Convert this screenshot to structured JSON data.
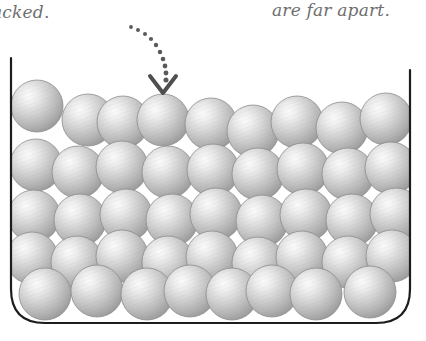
{
  "figure": {
    "background_color": "#ffffff"
  },
  "captions": {
    "left": {
      "text": "acked.",
      "full_text_hint": "packed.",
      "style": "italic",
      "color": "#6e6e6e",
      "clipped_at_left_edge": true
    },
    "right": {
      "text": "are far apart.",
      "style": "italic",
      "color": "#6e6e6e"
    }
  },
  "annotation": {
    "type": "dotted-curved-arrow",
    "dot_color": "#5a5a5a",
    "arrowhead": "chevron-down",
    "points_to": "top-row-sphere-4",
    "dots": [
      [
        131,
        27
      ],
      [
        138,
        30
      ],
      [
        145,
        34
      ],
      [
        151,
        39
      ],
      [
        156,
        45
      ],
      [
        160,
        52
      ],
      [
        163,
        59
      ],
      [
        165,
        66
      ],
      [
        166,
        73
      ],
      [
        166,
        80
      ]
    ],
    "arrow_apex": [
      163,
      93
    ],
    "arrow_left": [
      150,
      76
    ],
    "arrow_right": [
      176,
      76
    ]
  },
  "container": {
    "name": "beaker-open-container",
    "stroke_color": "#1d1d1d",
    "stroke_width": 2.2,
    "left_wall_x": 11,
    "right_wall_x": 410,
    "top_y_left": 58,
    "top_y_right": 70,
    "bottom_y": 323,
    "corner_radius": 34,
    "has_lid": false
  },
  "spheres": {
    "fill_light": "#f2f2f2",
    "fill_mid": "#c9c9c9",
    "fill_dark": "#9a9a9a",
    "edge_color": "#8d8d8d",
    "texture": "fine diagonal hatching",
    "count": 44,
    "rows": [
      {
        "row": 1,
        "label": "top-row",
        "items": [
          {
            "cx": 37,
            "cy": 106,
            "r": 26
          },
          {
            "cx": 88,
            "cy": 120,
            "r": 26
          },
          {
            "cx": 123,
            "cy": 122,
            "r": 26
          },
          {
            "cx": 163,
            "cy": 120,
            "r": 26
          },
          {
            "cx": 211,
            "cy": 124,
            "r": 26
          },
          {
            "cx": 253,
            "cy": 131,
            "r": 26
          },
          {
            "cx": 297,
            "cy": 122,
            "r": 26
          },
          {
            "cx": 342,
            "cy": 128,
            "r": 26
          },
          {
            "cx": 386,
            "cy": 119,
            "r": 26
          }
        ]
      },
      {
        "row": 2,
        "label": "second-row",
        "items": [
          {
            "cx": 36,
            "cy": 165,
            "r": 26
          },
          {
            "cx": 78,
            "cy": 172,
            "r": 26
          },
          {
            "cx": 122,
            "cy": 167,
            "r": 26
          },
          {
            "cx": 168,
            "cy": 172,
            "r": 26
          },
          {
            "cx": 213,
            "cy": 170,
            "r": 26
          },
          {
            "cx": 258,
            "cy": 174,
            "r": 26
          },
          {
            "cx": 303,
            "cy": 169,
            "r": 26
          },
          {
            "cx": 348,
            "cy": 174,
            "r": 26
          },
          {
            "cx": 391,
            "cy": 168,
            "r": 26
          }
        ]
      },
      {
        "row": 3,
        "label": "third-row",
        "items": [
          {
            "cx": 34,
            "cy": 216,
            "r": 26
          },
          {
            "cx": 80,
            "cy": 220,
            "r": 26
          },
          {
            "cx": 126,
            "cy": 215,
            "r": 26
          },
          {
            "cx": 172,
            "cy": 220,
            "r": 26
          },
          {
            "cx": 216,
            "cy": 214,
            "r": 26
          },
          {
            "cx": 262,
            "cy": 221,
            "r": 26
          },
          {
            "cx": 306,
            "cy": 215,
            "r": 26
          },
          {
            "cx": 352,
            "cy": 220,
            "r": 26
          },
          {
            "cx": 396,
            "cy": 214,
            "r": 26
          }
        ]
      },
      {
        "row": 4,
        "label": "fourth-row",
        "items": [
          {
            "cx": 32,
            "cy": 258,
            "r": 26
          },
          {
            "cx": 77,
            "cy": 262,
            "r": 26
          },
          {
            "cx": 122,
            "cy": 256,
            "r": 26
          },
          {
            "cx": 168,
            "cy": 262,
            "r": 26
          },
          {
            "cx": 212,
            "cy": 257,
            "r": 26
          },
          {
            "cx": 258,
            "cy": 263,
            "r": 26
          },
          {
            "cx": 302,
            "cy": 257,
            "r": 26
          },
          {
            "cx": 348,
            "cy": 262,
            "r": 26
          },
          {
            "cx": 392,
            "cy": 256,
            "r": 26
          }
        ]
      },
      {
        "row": 5,
        "label": "bottom-row",
        "items": [
          {
            "cx": 45,
            "cy": 294,
            "r": 26
          },
          {
            "cx": 97,
            "cy": 291,
            "r": 26
          },
          {
            "cx": 147,
            "cy": 294,
            "r": 26
          },
          {
            "cx": 190,
            "cy": 291,
            "r": 26
          },
          {
            "cx": 232,
            "cy": 294,
            "r": 26
          },
          {
            "cx": 272,
            "cy": 291,
            "r": 26
          },
          {
            "cx": 316,
            "cy": 294,
            "r": 26
          },
          {
            "cx": 370,
            "cy": 292,
            "r": 26
          }
        ]
      }
    ]
  }
}
